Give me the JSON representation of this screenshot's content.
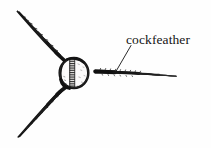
{
  "figure": {
    "title": "cockfeather",
    "background_color": "#fefefe",
    "ink_color": "#1a1a1a",
    "width": 211,
    "height": 148
  },
  "labels": {
    "cockfeather": "cockfeather"
  },
  "annotation": {
    "leader_line": {
      "name": "leader-line",
      "from_x": 131,
      "from_y": 46,
      "to_x": 116,
      "to_y": 71,
      "color": "#2a2a2a"
    }
  },
  "elements": {
    "nock_circle": {
      "name": "nock-circle",
      "center_x": 74,
      "center_y": 73,
      "radius_x": 15,
      "radius_y": 15.5,
      "outline_color": "#141414"
    },
    "feathers": [
      {
        "name": "upper-left-feather",
        "tip_x": 17,
        "tip_y": 10,
        "base_x": 64,
        "base_y": 60,
        "thick_end": "base"
      },
      {
        "name": "lower-left-feather",
        "tip_x": 18,
        "tip_y": 138,
        "base_x": 65,
        "base_y": 88,
        "thick_end": "base"
      },
      {
        "name": "cockfeather-stroke",
        "base_x": 95,
        "base_y": 72,
        "tip_x": 176,
        "tip_y": 76,
        "thick_end": "base"
      }
    ]
  }
}
